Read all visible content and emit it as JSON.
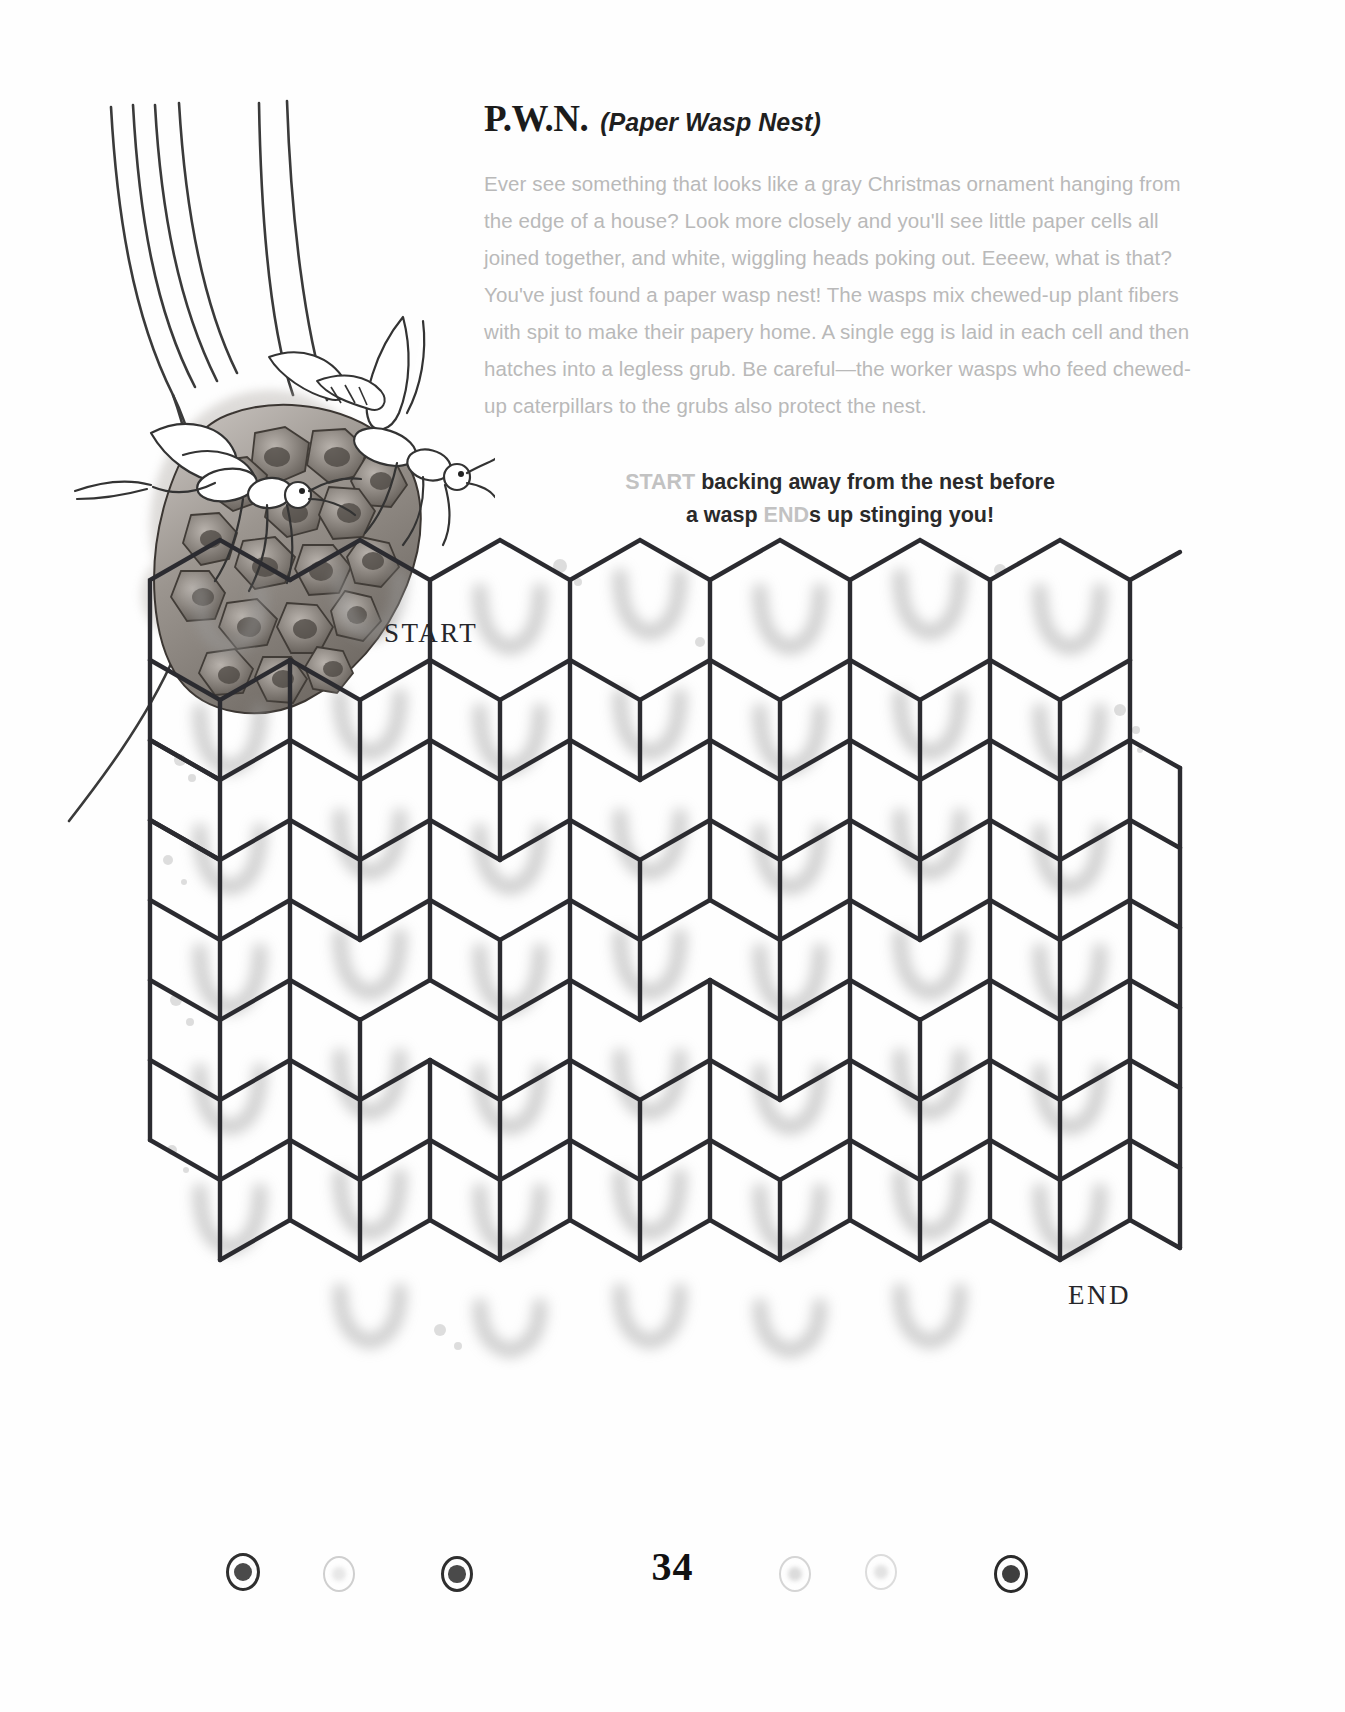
{
  "page": {
    "number": "34"
  },
  "header": {
    "title_abbr": "P.W.N.",
    "title_expand": "(Paper Wasp Nest)",
    "body": "Ever see something that looks like a gray Christmas ornament hanging from the edge of a house? Look more closely and you'll see little paper cells all joined together, and white, wiggling heads poking out. Eeeew, what is that? You've just found a paper wasp nest! The wasps mix chewed-up plant fibers with spit to make their papery home. A single egg is laid in each cell and then hatches into a legless grub. Be careful—the worker wasps who feed chewed-up caterpillars to the grubs also protect the nest."
  },
  "instructions": {
    "line1_keyword": "START",
    "line1_rest": " backing away from the nest before",
    "line2_pre": "a wasp ",
    "line2_keyword": "END",
    "line2_rest": "s up stinging you!"
  },
  "maze": {
    "start_label": "START",
    "end_label": "END",
    "grid_cols": 7,
    "grid_rows": 7,
    "wall_color": "#2b2b30",
    "cell_fill": "#ffffff"
  },
  "footer": {
    "dots": [
      {
        "name": "dot-1",
        "x": 243,
        "y": 1570,
        "r": 17,
        "filled": true,
        "ring": "#2f2f2f",
        "core": "#4a4a4a"
      },
      {
        "name": "dot-2",
        "x": 339,
        "y": 1572,
        "r": 16,
        "filled": false,
        "ring": "#cfcfcf",
        "core": "#d8d8d8"
      },
      {
        "name": "dot-3",
        "x": 457,
        "y": 1572,
        "r": 16,
        "filled": true,
        "ring": "#2f2f2f",
        "core": "#4a4a4a"
      },
      {
        "name": "dot-4",
        "x": 795,
        "y": 1572,
        "r": 16,
        "filled": false,
        "ring": "#d5d5d5",
        "core": "#c4c4c4"
      },
      {
        "name": "dot-5",
        "x": 881,
        "y": 1570,
        "r": 16,
        "filled": false,
        "ring": "#dcdcdc",
        "core": "#d0d0d0"
      },
      {
        "name": "dot-6",
        "x": 1011,
        "y": 1572,
        "r": 17,
        "filled": true,
        "ring": "#2a2a2a",
        "core": "#3e3e3e"
      }
    ]
  },
  "colors": {
    "ink": "#1b1b1b",
    "faded_text": "#b9b9b9",
    "maze_wall": "#2b2b30",
    "keyword": "#c2c2c2"
  }
}
